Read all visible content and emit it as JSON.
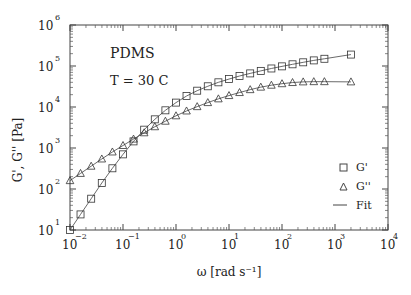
{
  "chart_data": {
    "type": "scatter",
    "title": "",
    "annotations": [
      "PDMS",
      "T = 30 C"
    ],
    "xlabel": "ω [rad s⁻¹]",
    "ylabel": "G', G'' [Pa]",
    "xscale": "log",
    "yscale": "log",
    "xlim": [
      0.01,
      10000
    ],
    "ylim": [
      10,
      1000000
    ],
    "x_ticks": [
      "10^-2",
      "10^-1",
      "10^0",
      "10^1",
      "10^2",
      "10^3",
      "10^4"
    ],
    "y_ticks": [
      "10^1",
      "10^2",
      "10^3",
      "10^4",
      "10^5",
      "10^6"
    ],
    "legend": {
      "position": "lower right",
      "entries": [
        {
          "label": "G'",
          "marker": "square"
        },
        {
          "label": "G''",
          "marker": "triangle"
        },
        {
          "label": "Fit",
          "marker": "line"
        }
      ]
    },
    "grid": false,
    "x": [
      0.01,
      0.0158,
      0.0251,
      0.0398,
      0.0631,
      0.1,
      0.158,
      0.251,
      0.398,
      0.631,
      1,
      1.58,
      2.51,
      3.98,
      6.31,
      10,
      15.8,
      25.1,
      39.8,
      63.1,
      100,
      158,
      251,
      398,
      631,
      2000
    ],
    "series": [
      {
        "name": "G'",
        "marker": "square",
        "values": [
          10,
          24,
          58,
          140,
          320,
          700,
          1450,
          2800,
          5000,
          8300,
          12800,
          18500,
          25000,
          32000,
          40000,
          48000,
          57000,
          66000,
          76000,
          87000,
          98000,
          110000,
          123000,
          137000,
          150000,
          190000
        ]
      },
      {
        "name": "G''",
        "marker": "triangle",
        "values": [
          160,
          240,
          360,
          540,
          800,
          1150,
          1650,
          2350,
          3300,
          4500,
          6100,
          8000,
          10200,
          12800,
          15800,
          19000,
          22500,
          26500,
          30500,
          34000,
          37000,
          39500,
          41000,
          41500,
          41500,
          41000
        ]
      }
    ]
  }
}
